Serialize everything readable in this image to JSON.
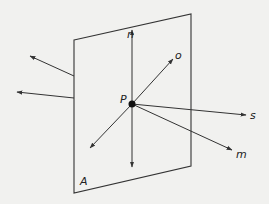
{
  "diagram": {
    "type": "vectors-through-plane",
    "colors": {
      "background": "#f1f1ef",
      "stroke": "#333333"
    },
    "plane": {
      "label": "A",
      "corners": [
        [
          74,
          40
        ],
        [
          191,
          14
        ],
        [
          191,
          166
        ],
        [
          74,
          193
        ]
      ]
    },
    "point": {
      "label": "P",
      "x": 132,
      "y": 104
    },
    "vectors": [
      {
        "label": "n",
        "from": [
          132,
          104
        ],
        "to": [
          132,
          30
        ]
      },
      {
        "label": "o",
        "from": [
          132,
          104
        ],
        "to": [
          173,
          59
        ]
      },
      {
        "label": "s",
        "from": [
          132,
          104
        ],
        "to": [
          246,
          115
        ]
      },
      {
        "label": "m",
        "from": [
          132,
          104
        ],
        "to": [
          232,
          150
        ]
      },
      {
        "label": "",
        "from": [
          132,
          104
        ],
        "to": [
          90,
          148
        ]
      },
      {
        "label": "",
        "from": [
          132,
          104
        ],
        "to": [
          132,
          167
        ]
      },
      {
        "label": "",
        "from": [
          74,
          76
        ],
        "to": [
          30,
          56
        ]
      },
      {
        "label": "",
        "from": [
          74,
          98
        ],
        "to": [
          17,
          92
        ]
      }
    ]
  }
}
